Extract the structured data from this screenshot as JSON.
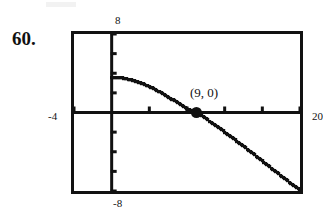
{
  "exercise": {
    "number_label": "60."
  },
  "calculator_window": {
    "ymax_label": "8",
    "ymin_label": "-8",
    "xmin_label": "-4",
    "xmax_label": "20",
    "xmin": -4,
    "xmax": 20,
    "ymin": -8,
    "ymax": 8,
    "x_tick_step": 4,
    "y_tick_step": 2,
    "frame_color": "#121212",
    "curve_color": "#111111"
  },
  "annotation": {
    "point_label": "(9, 0)",
    "point_x": 9,
    "point_y": 0
  },
  "chart_data": {
    "type": "line",
    "title": "",
    "xlabel": "",
    "ylabel": "",
    "xlim": [
      -4,
      20
    ],
    "ylim": [
      -8,
      8
    ],
    "grid": false,
    "legend": false,
    "x_ticks": [
      -4,
      0,
      4,
      8,
      12,
      16,
      20
    ],
    "y_ticks": [
      -8,
      -6,
      -4,
      -2,
      0,
      2,
      4,
      6,
      8
    ],
    "annotations": [
      {
        "text": "(9, 0)",
        "x": 9,
        "y": 0,
        "marker": "filled-circle"
      }
    ],
    "series": [
      {
        "name": "y = 8 - sqrt(x+7) - ... (square-root style decreasing curve)",
        "style": "pixelated-calculator-trace",
        "x": [
          0,
          0.5,
          1,
          1.5,
          2,
          2.5,
          3,
          3.5,
          4,
          4.5,
          5,
          5.5,
          6,
          6.5,
          7,
          7.5,
          8,
          8.5,
          9,
          9.5,
          10,
          10.5,
          11,
          11.5,
          12,
          12.5,
          13,
          13.5,
          14,
          14.5,
          15,
          15.5,
          16,
          16.5,
          17,
          17.5,
          18,
          18.5,
          19,
          19.5,
          20
        ],
        "y": [
          3.6,
          3.6,
          3.55,
          3.45,
          3.35,
          3.2,
          3.05,
          2.85,
          2.65,
          2.4,
          2.15,
          1.9,
          1.6,
          1.3,
          1.0,
          0.7,
          0.4,
          0.2,
          0.0,
          -0.3,
          -0.6,
          -0.95,
          -1.3,
          -1.65,
          -2.0,
          -2.35,
          -2.7,
          -3.1,
          -3.45,
          -3.8,
          -4.2,
          -4.55,
          -4.95,
          -5.3,
          -5.7,
          -6.05,
          -6.45,
          -6.8,
          -7.2,
          -7.55,
          -7.9
        ]
      }
    ]
  }
}
